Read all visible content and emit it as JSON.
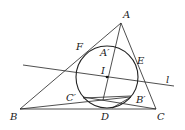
{
  "diagram": {
    "type": "geometry",
    "points": {
      "A": {
        "label": "A",
        "x": 121,
        "y": 23
      },
      "B": {
        "label": "B",
        "x": 20,
        "y": 109
      },
      "C": {
        "label": "C",
        "x": 156,
        "y": 109
      },
      "I": {
        "label": "I",
        "x": 107,
        "y": 77
      },
      "D": {
        "label": "D",
        "x": 104,
        "y": 108
      },
      "E": {
        "label": "E",
        "x": 137,
        "y": 61
      },
      "F": {
        "label": "F",
        "x": 85,
        "y": 51
      },
      "A_prime": {
        "label": "A′",
        "x": 111,
        "y": 44
      },
      "B_prime": {
        "label": "B′",
        "x": 130,
        "y": 98
      },
      "C_prime": {
        "label": "C′",
        "x": 84,
        "y": 98
      }
    },
    "line_l": {
      "label": "l"
    },
    "incircle": {
      "cx": 107,
      "cy": 77,
      "r": 31
    }
  }
}
